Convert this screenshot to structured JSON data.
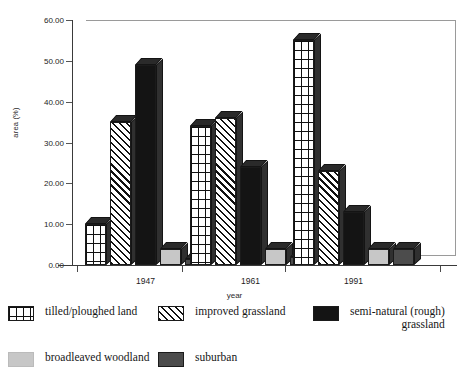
{
  "chart_data": {
    "type": "bar",
    "title": "",
    "subtitle": "",
    "xlabel": "year",
    "ylabel": "area (%)",
    "categories": [
      "1947",
      "1961",
      "1991"
    ],
    "ylim": [
      0,
      60
    ],
    "yticks": [
      "0.00",
      "10.00",
      "20.00",
      "30.00",
      "40.00",
      "50.00",
      "60.00"
    ],
    "ytick_values": [
      0,
      10,
      20,
      30,
      40,
      50,
      60
    ],
    "grid": false,
    "legend_position": "bottom",
    "style": "3d-column",
    "series": [
      {
        "name": "tilled/ploughed land",
        "pattern": "grid",
        "color": "#ffffff",
        "values": [
          10,
          34,
          55
        ]
      },
      {
        "name": "improved grassland",
        "pattern": "diagonal",
        "color": "#ffffff",
        "values": [
          35,
          36,
          23
        ]
      },
      {
        "name": "semi-natural (rough) grassland",
        "pattern": "solid",
        "color": "#141414",
        "values": [
          49,
          24,
          13
        ]
      },
      {
        "name": "broadleaved woodland",
        "pattern": "solid-light",
        "color": "#c7c7c7",
        "values": [
          4,
          4,
          4
        ]
      },
      {
        "name": "suburban",
        "pattern": "solid-dark",
        "color": "#4c4c4c",
        "values": [
          1.5,
          2,
          4
        ]
      }
    ]
  },
  "legend": {
    "items": [
      {
        "label": "tilled/ploughed land",
        "icon": "grid-swatch-icon"
      },
      {
        "label": "improved grassland",
        "icon": "diagonal-hatch-swatch-icon"
      },
      {
        "label": "semi-natural (rough)\ngrassland",
        "icon": "black-swatch-icon"
      },
      {
        "label": "broadleaved woodland",
        "icon": "light-gray-swatch-icon"
      },
      {
        "label": "suburban",
        "icon": "dark-gray-swatch-icon"
      }
    ]
  },
  "colors": {
    "axis": "#3a3a3a",
    "frame": "#9a9a9a",
    "bar_outline": "#1b1b1b",
    "semi_natural": "#141414",
    "broadleaved": "#c7c7c7",
    "suburban": "#4c4c4c"
  }
}
